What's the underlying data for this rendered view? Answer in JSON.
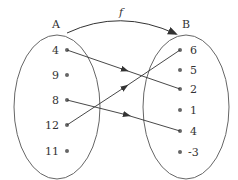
{
  "diagram": {
    "function_label": "f",
    "domain": {
      "label": "A",
      "elements": [
        "4",
        "9",
        "8",
        "12",
        "11"
      ]
    },
    "codomain": {
      "label": "B",
      "elements": [
        "6",
        "5",
        "2",
        "1",
        "4",
        "-3"
      ]
    },
    "mappings": [
      {
        "from": "4",
        "to": "2"
      },
      {
        "from": "8",
        "to": "4"
      },
      {
        "from": "12",
        "to": "6"
      }
    ],
    "colors": {
      "stroke": "#555555",
      "text": "#333333",
      "dot": "#666666"
    }
  }
}
